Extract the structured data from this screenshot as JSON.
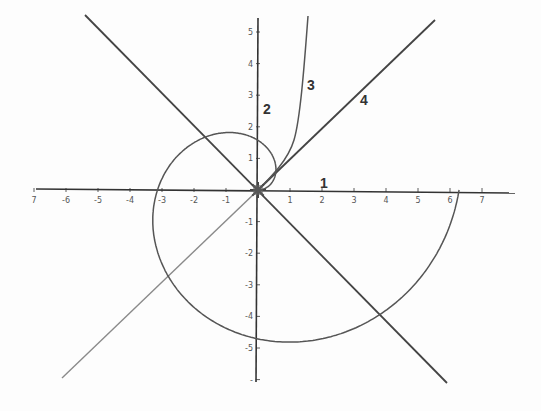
{
  "diagram": {
    "type": "polar-coordinate-plot",
    "origin_px": [
      258,
      190
    ],
    "scale_px_per_unit": {
      "x": 32,
      "y": 31.6
    },
    "colors": {
      "axis": "#333333",
      "spiral": "#555555",
      "line_dark": "#444444",
      "line_gray": "#8a8a8a",
      "tick_label": "#555555",
      "curve_label": "#333333"
    },
    "x_ticks": [
      {
        "value": -7,
        "label": "7"
      },
      {
        "value": -6,
        "label": "-6"
      },
      {
        "value": -5,
        "label": "-5"
      },
      {
        "value": -4,
        "label": "-4"
      },
      {
        "value": -3,
        "label": "-3"
      },
      {
        "value": -2,
        "label": "-2"
      },
      {
        "value": -1,
        "label": "-1"
      },
      {
        "value": 1,
        "label": "1"
      },
      {
        "value": 2,
        "label": "2"
      },
      {
        "value": 3,
        "label": "3"
      },
      {
        "value": 4,
        "label": "4"
      },
      {
        "value": 5,
        "label": "5"
      },
      {
        "value": 6,
        "label": "6"
      },
      {
        "value": 7,
        "label": "7"
      }
    ],
    "y_ticks": [
      {
        "value": 5,
        "label": "5"
      },
      {
        "value": 4,
        "label": "4"
      },
      {
        "value": 3,
        "label": "3"
      },
      {
        "value": 2,
        "label": "2"
      },
      {
        "value": 1,
        "label": "1"
      },
      {
        "value": -1,
        "label": "-1"
      },
      {
        "value": -2,
        "label": "-2"
      },
      {
        "value": -3,
        "label": "-3"
      },
      {
        "value": -4,
        "label": "-4"
      },
      {
        "value": -5,
        "label": "-5"
      },
      {
        "value": -6,
        "label": "-"
      }
    ],
    "curve_labels": [
      {
        "id": "1",
        "text": "1",
        "x": 320,
        "y": 188
      },
      {
        "id": "2",
        "text": "2",
        "x": 263,
        "y": 114
      },
      {
        "id": "3",
        "text": "3",
        "x": 307,
        "y": 90
      },
      {
        "id": "4",
        "text": "4",
        "x": 360,
        "y": 105
      }
    ],
    "spiral": {
      "equation": "r = θ",
      "theta_max": 6.2832
    },
    "lines": [
      {
        "name": "diagonal-negative-slope",
        "from": [
          85,
          15
        ],
        "to": [
          447,
          383
        ],
        "color_key": "line_dark"
      },
      {
        "name": "diagonal-lower-left",
        "from": [
          62,
          378
        ],
        "to": [
          258,
          190
        ],
        "color_key": "line_gray"
      },
      {
        "name": "line-4",
        "from": [
          258,
          190
        ],
        "to": [
          435,
          20
        ],
        "color_key": "line_dark"
      }
    ]
  }
}
